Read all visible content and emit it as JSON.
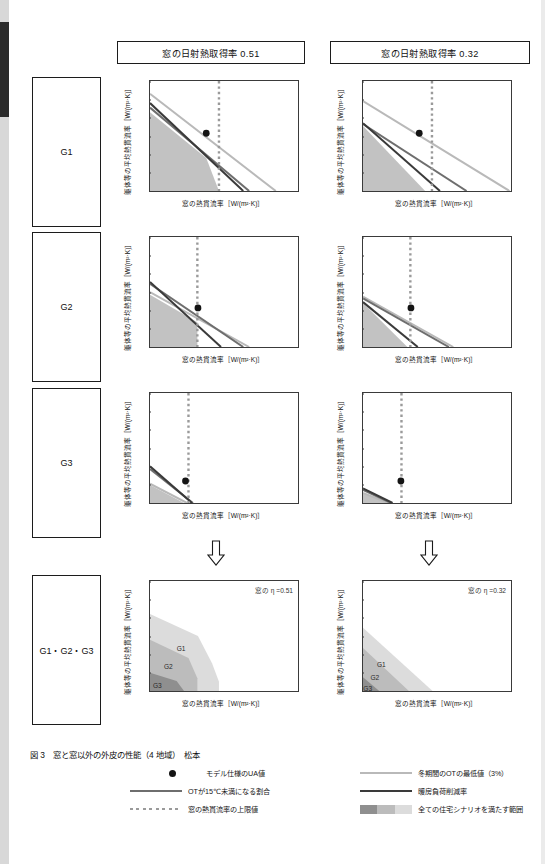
{
  "figure": {
    "caption": "図 3　窓と窓以外の外皮の性能（4 地域）　松本"
  },
  "headers": {
    "left": "窓の日射熱取得率  0.51",
    "right": "窓の日射熱取得率  0.32"
  },
  "row_labels": {
    "g1": "G1",
    "g2": "G2",
    "g3": "G3",
    "all": "G1・G2・G3"
  },
  "axes": {
    "xlabel": "窓の熱貫流率［W/(m²·K)］",
    "ylabel": "躯体等の平均熱貫流率［W/(m²·K)］",
    "xticks": [
      "0",
      "1",
      "2",
      "3",
      "4",
      "5"
    ],
    "yticks": [
      "0",
      "0.1",
      "0.2",
      "0.3",
      "0.4",
      "0.5",
      "0.6"
    ]
  },
  "annotations": {
    "eta_left": "窓の η =0.51",
    "eta_right": "窓の η =0.32",
    "band_g1": "G1",
    "band_g2": "G2",
    "band_g3": "G3"
  },
  "colors": {
    "ot_min_line": "#b9b9b9",
    "ot_below15_line": "#6e6e6e",
    "heating_load_line": "#3a3a3a",
    "upper_limit_dotted": "#9a9a9a",
    "marker": "#141414",
    "band_dark": "#8f8f8f",
    "band_mid": "#bcbcbc",
    "band_light": "#dcdcdc"
  },
  "legend": {
    "items": [
      {
        "key": "marker",
        "label": "モデル仕様のUA値"
      },
      {
        "key": "line-mid",
        "label": "OTが15℃未満になる割合"
      },
      {
        "key": "dotted",
        "label": "窓の熱貫流率の上限値"
      },
      {
        "key": "line-light",
        "label": "冬期間のOTの最低値（3%）"
      },
      {
        "key": "line-dark",
        "label": "暖房負荷削減率"
      },
      {
        "key": "swatch",
        "label": "全ての住宅シナリオを満たす範囲"
      }
    ]
  },
  "chart_data": [
    {
      "id": "g1-left",
      "type": "line",
      "grade": "G1",
      "eta": 0.51,
      "title": "窓の日射熱取得率 0.51 / G1",
      "xlabel": "窓の熱貫流率［W/(m²·K)］",
      "ylabel": "躯体等の平均熱貫流率［W/(m²·K)］",
      "xlim": [
        0,
        5
      ],
      "ylim": [
        0,
        0.6
      ],
      "grid": false,
      "legend": "none",
      "series": [
        {
          "name": "冬期間のOTの最低値（3%）",
          "color": "#b9b9b9",
          "x": [
            0,
            4.25
          ],
          "y": [
            0.53,
            0.0
          ]
        },
        {
          "name": "OTが15℃未満になる割合",
          "color": "#6e6e6e",
          "x": [
            0,
            3.35
          ],
          "y": [
            0.455,
            0.0
          ]
        },
        {
          "name": "暖房負荷削減率",
          "color": "#3a3a3a",
          "x": [
            0,
            3.15
          ],
          "y": [
            0.48,
            0.0
          ]
        }
      ],
      "upper_limit_x": 2.33,
      "marker": {
        "x": 1.9,
        "y": 0.315
      },
      "feasible_band": {
        "x": [
          0,
          0,
          1.9,
          2.33
        ],
        "y": [
          0,
          0.43,
          0.18,
          0
        ]
      }
    },
    {
      "id": "g1-right",
      "type": "line",
      "grade": "G1",
      "eta": 0.32,
      "title": "窓の日射熱取得率 0.32 / G1",
      "xlim": [
        0,
        5
      ],
      "ylim": [
        0,
        0.6
      ],
      "grid": false,
      "legend": "none",
      "series": [
        {
          "name": "冬期間のOTの最低値（3%）",
          "color": "#b9b9b9",
          "x": [
            0,
            4.95
          ],
          "y": [
            0.49,
            0.0
          ]
        },
        {
          "name": "OTが15℃未満になる割合",
          "color": "#6e6e6e",
          "x": [
            0,
            3.5
          ],
          "y": [
            0.365,
            0.0
          ]
        },
        {
          "name": "暖房負荷削減率",
          "color": "#3a3a3a",
          "x": [
            0,
            2.6
          ],
          "y": [
            0.37,
            0.0
          ]
        }
      ],
      "upper_limit_x": 2.33,
      "marker": {
        "x": 1.9,
        "y": 0.315
      },
      "feasible_band": {
        "x": [
          0,
          0,
          2.1
        ],
        "y": [
          0,
          0.355,
          0
        ]
      }
    },
    {
      "id": "g2-left",
      "type": "line",
      "grade": "G2",
      "eta": 0.51,
      "xlim": [
        0,
        5
      ],
      "ylim": [
        0,
        0.6
      ],
      "grid": false,
      "legend": "none",
      "series": [
        {
          "name": "冬期間のOTの最低値（3%）",
          "color": "#b9b9b9",
          "x": [
            0,
            3.35
          ],
          "y": [
            0.3,
            0.0
          ]
        },
        {
          "name": "OTが15℃未満になる割合",
          "color": "#6e6e6e",
          "x": [
            0,
            3.15
          ],
          "y": [
            0.345,
            0.0
          ]
        },
        {
          "name": "暖房負荷削減率",
          "color": "#3a3a3a",
          "x": [
            0,
            2.4
          ],
          "y": [
            0.355,
            0.0
          ]
        }
      ],
      "upper_limit_x": 1.6,
      "marker": {
        "x": 1.62,
        "y": 0.213
      },
      "feasible_band": {
        "x": [
          0,
          0,
          1.6,
          1.6
        ],
        "y": [
          0,
          0.285,
          0.135,
          0
        ]
      }
    },
    {
      "id": "g2-right",
      "type": "line",
      "grade": "G2",
      "eta": 0.32,
      "xlim": [
        0,
        5
      ],
      "ylim": [
        0,
        0.6
      ],
      "grid": false,
      "legend": "none",
      "series": [
        {
          "name": "冬期間のOTの最低値（3%）",
          "color": "#b9b9b9",
          "x": [
            0,
            3.05
          ],
          "y": [
            0.275,
            0.0
          ]
        },
        {
          "name": "OTが15℃未満になる割合",
          "color": "#6e6e6e",
          "x": [
            0,
            2.9
          ],
          "y": [
            0.265,
            0.0
          ]
        },
        {
          "name": "暖房負荷削減率",
          "color": "#3a3a3a",
          "x": [
            0,
            1.85
          ],
          "y": [
            0.245,
            0.0
          ]
        }
      ],
      "upper_limit_x": 1.6,
      "marker": {
        "x": 1.62,
        "y": 0.213
      },
      "feasible_band": {
        "x": [
          0,
          0,
          1.5
        ],
        "y": [
          0,
          0.24,
          0
        ]
      }
    },
    {
      "id": "g3-left",
      "type": "line",
      "grade": "G3",
      "eta": 0.51,
      "xlim": [
        0,
        5
      ],
      "ylim": [
        0,
        0.6
      ],
      "grid": false,
      "legend": "none",
      "series": [
        {
          "name": "冬期間のOTの最低値（3%）",
          "color": "#b9b9b9",
          "x": [
            0,
            1.25
          ],
          "y": [
            0.105,
            0.0
          ]
        },
        {
          "name": "OTが15℃未満になる割合",
          "color": "#6e6e6e",
          "x": [
            0,
            1.45
          ],
          "y": [
            0.185,
            0.0
          ]
        },
        {
          "name": "暖房負荷削減率",
          "color": "#3a3a3a",
          "x": [
            0,
            1.42
          ],
          "y": [
            0.2,
            0.0
          ]
        }
      ],
      "upper_limit_x": 1.3,
      "marker": {
        "x": 1.2,
        "y": 0.12
      },
      "feasible_band": {
        "x": [
          0,
          0,
          1.15
        ],
        "y": [
          0,
          0.098,
          0
        ]
      }
    },
    {
      "id": "g3-right",
      "type": "line",
      "grade": "G3",
      "eta": 0.32,
      "xlim": [
        0,
        5
      ],
      "ylim": [
        0,
        0.6
      ],
      "grid": false,
      "legend": "none",
      "series": [
        {
          "name": "冬期間のOTの最低値（3%）",
          "color": "#b9b9b9",
          "x": [
            0,
            0.85
          ],
          "y": [
            0.055,
            0.0
          ]
        },
        {
          "name": "OTが15℃未満になる割合",
          "color": "#6e6e6e",
          "x": [
            0,
            0.95
          ],
          "y": [
            0.072,
            0.0
          ]
        },
        {
          "name": "暖房負荷削減率",
          "color": "#3a3a3a",
          "x": [
            0,
            1.0
          ],
          "y": [
            0.08,
            0.0
          ]
        }
      ],
      "upper_limit_x": 1.3,
      "marker": {
        "x": 1.28,
        "y": 0.12
      },
      "feasible_band": {
        "x": [
          0,
          0,
          0.82
        ],
        "y": [
          0,
          0.055,
          0
        ]
      }
    },
    {
      "id": "combined-left",
      "type": "area",
      "grade": "G1・G2・G3",
      "eta": 0.51,
      "note": "窓の η =0.51",
      "xlim": [
        0,
        5
      ],
      "ylim": [
        0,
        0.6
      ],
      "grid": false,
      "legend": "in-plot",
      "bands": [
        {
          "name": "G1",
          "color": "#dcdcdc",
          "x": [
            0,
            0,
            1.62,
            2.1,
            2.33,
            2.33
          ],
          "y": [
            0,
            0.42,
            0.3,
            0.15,
            0.05,
            0
          ]
        },
        {
          "name": "G2",
          "color": "#bcbcbc",
          "x": [
            0,
            0,
            1.3,
            1.6,
            1.6
          ],
          "y": [
            0,
            0.28,
            0.18,
            0.07,
            0
          ]
        },
        {
          "name": "G3",
          "color": "#8f8f8f",
          "x": [
            0,
            0,
            0.9,
            1.15
          ],
          "y": [
            0,
            0.1,
            0.055,
            0
          ]
        }
      ],
      "band_labels": [
        {
          "text": "G1",
          "x": 1.05,
          "y": 0.235
        },
        {
          "text": "G2",
          "x": 0.62,
          "y": 0.135
        },
        {
          "text": "G3",
          "x": 0.25,
          "y": 0.035
        }
      ]
    },
    {
      "id": "combined-right",
      "type": "area",
      "grade": "G1・G2・G3",
      "eta": 0.32,
      "note": "窓の η =0.32",
      "xlim": [
        0,
        5
      ],
      "ylim": [
        0,
        0.6
      ],
      "grid": false,
      "legend": "in-plot",
      "bands": [
        {
          "name": "G1",
          "color": "#dcdcdc",
          "x": [
            0,
            0,
            2.35
          ],
          "y": [
            0,
            0.345,
            0
          ]
        },
        {
          "name": "G2",
          "color": "#bcbcbc",
          "x": [
            0,
            0,
            1.55
          ],
          "y": [
            0,
            0.235,
            0
          ]
        },
        {
          "name": "G3",
          "color": "#8f8f8f",
          "x": [
            0,
            0,
            0.55
          ],
          "y": [
            0,
            0.075,
            0
          ]
        }
      ],
      "band_labels": [
        {
          "text": "G1",
          "x": 0.62,
          "y": 0.145
        },
        {
          "text": "G2",
          "x": 0.4,
          "y": 0.075
        },
        {
          "text": "G3",
          "x": 0.16,
          "y": 0.018
        }
      ]
    }
  ]
}
